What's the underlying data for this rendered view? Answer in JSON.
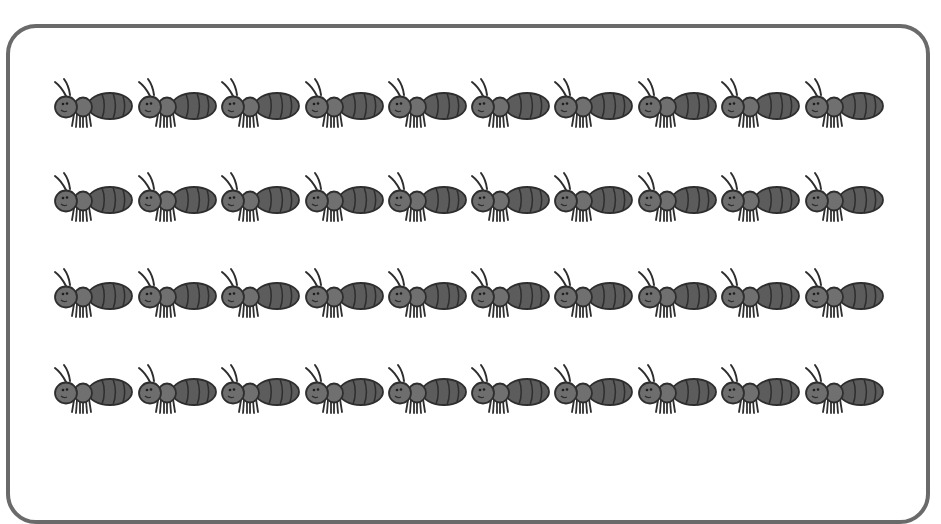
{
  "worksheet": {
    "rows": 4,
    "columns": 10,
    "total_ants": 40,
    "item_icon": "ant-icon",
    "colors": {
      "frame": "#6a6a6a",
      "ant_body": "#6e6e6e",
      "ant_abdomen": "#5c5c5c",
      "ant_outline": "#2e2e2e",
      "background": "#ffffff"
    },
    "row_y": [
      76,
      170,
      266,
      362
    ],
    "col_x": [
      50,
      134,
      217,
      301,
      384,
      467,
      550,
      634,
      717,
      801
    ]
  }
}
